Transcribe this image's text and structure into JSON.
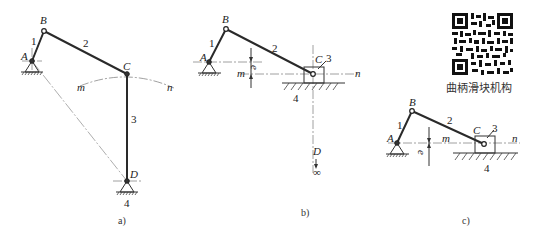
{
  "figures": [
    {
      "id": "a",
      "caption": "a)",
      "type": "four-bar linkage (crank-rocker)",
      "points": {
        "A": "A",
        "B": "B",
        "C": "C",
        "D": "D",
        "m": "m",
        "n": "n"
      },
      "links": {
        "1": "1",
        "2": "2",
        "3": "3",
        "4": "4"
      }
    },
    {
      "id": "b",
      "caption": "b)",
      "type": "offset slider-crank (derived, D at infinity)",
      "points": {
        "A": "A",
        "B": "B",
        "C": "C",
        "D": "D",
        "m": "m",
        "n": "n"
      },
      "links": {
        "1": "1",
        "2": "2",
        "3": "3",
        "4": "4"
      },
      "offset_label": "e",
      "infinity_symbol": "∞"
    },
    {
      "id": "c",
      "caption": "c)",
      "type": "offset slider-crank",
      "points": {
        "A": "A",
        "B": "B",
        "C": "C",
        "m": "m",
        "n": "n"
      },
      "links": {
        "1": "1",
        "2": "2",
        "3": "3",
        "4": "4"
      },
      "offset_label": "e"
    }
  ],
  "qr": {
    "label": "曲柄滑块机构",
    "icon": "qr-code-icon"
  }
}
